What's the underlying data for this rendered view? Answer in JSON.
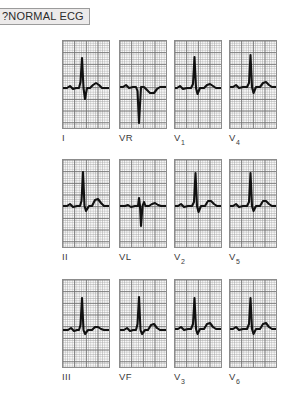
{
  "caption": {
    "text": "?NORMAL ECG"
  },
  "figure": {
    "name": "12-lead-ecg",
    "rows": 3,
    "columns": 4,
    "grid_color": "#6e6e6e",
    "trace_color": "#111111",
    "panel_border_color": "#8c8c8c",
    "paper_color": "#fbfbfb"
  },
  "chart_data": {
    "type": "line",
    "title": "?NORMAL ECG",
    "subtitle": "",
    "xlabel": "",
    "ylabel": "",
    "grid": true,
    "legend_position": "below-each-panel",
    "panel_layout": [
      [
        "I",
        "VR",
        "V1",
        "V4"
      ],
      [
        "II",
        "VL",
        "V2",
        "V5"
      ],
      [
        "III",
        "VF",
        "V3",
        "V6"
      ]
    ],
    "series": [
      {
        "name": "I",
        "label_base": "I",
        "label_sub": "",
        "row": 0,
        "column": 0,
        "baseline_y": 47,
        "qrs_direction": "positive",
        "r_amplitude": 30,
        "s_amplitude": 11,
        "t_amplitude": 5,
        "path": "M -6,47 L 4,47 L 7,45 L 10,48 L 13,47 L 16,47 L 17.5,41 L 19,17 L 20.5,47 L 22,58 L 24,47 L 27,47 L 30,44 L 33,42 L 36,44 L 39,47 L 54,47"
      },
      {
        "name": "VR",
        "label_base": "VR",
        "label_sub": "",
        "row": 0,
        "column": 1,
        "baseline_y": 46,
        "qrs_direction": "negative",
        "r_amplitude": 0,
        "s_amplitude": 36,
        "t_amplitude": -5,
        "path": "M -6,46 L 3,46 L 6,44 L 9,47 L 13,46 L 16,46 L 17.5,50 L 19,82 L 21,46 L 24,46 L 27,49 L 30,52 L 34,52 L 37,48 L 40,46 L 54,46"
      },
      {
        "name": "V1",
        "label_base": "V",
        "label_sub": "1",
        "row": 0,
        "column": 2,
        "baseline_y": 47,
        "qrs_direction": "positive",
        "r_amplitude": 31,
        "s_amplitude": 6,
        "t_amplitude": 4,
        "path": "M -6,47 L 2,47 L 5,45 L 8,48 L 12,47 L 16,47 L 18,43 L 19.5,16 L 21,47 L 22.5,53 L 25,47 L 29,47 L 32,44 L 35,43 L 38,45 L 41,47 L 54,47"
      },
      {
        "name": "V4",
        "label_base": "V",
        "label_sub": "4",
        "row": 0,
        "column": 3,
        "baseline_y": 46,
        "qrs_direction": "positive",
        "r_amplitude": 32,
        "s_amplitude": 6,
        "t_amplitude": 5,
        "path": "M -6,46 L 3,46 L 6,44 L 9,47 L 13,46 L 17,46 L 19,42 L 20.5,14 L 22,46 L 23.5,52 L 26,46 L 30,46 L 33,42 L 36,41 L 39,44 L 42,46 L 54,46"
      },
      {
        "name": "II",
        "label_base": "II",
        "label_sub": "",
        "row": 1,
        "column": 0,
        "baseline_y": 46,
        "qrs_direction": "positive",
        "r_amplitude": 34,
        "s_amplitude": 5,
        "t_amplitude": 6,
        "path": "M -6,46 L 4,46 L 7,44 L 10,47 L 14,46 L 17,46 L 18.5,41 L 20,12 L 21.5,46 L 23,51 L 26,46 L 29,46 L 32,40 L 35,39 L 38,43 L 41,46 L 54,46"
      },
      {
        "name": "VL",
        "label_base": "VL",
        "label_sub": "",
        "row": 1,
        "column": 1,
        "baseline_y": 46,
        "qrs_direction": "equiphasic",
        "r_amplitude": 9,
        "s_amplitude": 20,
        "t_amplitude": 3,
        "path": "M -6,46 L 5,46 L 8,45 L 11,47 L 15,46 L 18,46 L 19,38 L 20,46 L 21,66 L 22.5,46 L 24,42 L 25.5,46 L 29,46 L 32,44 L 35,43 L 38,45 L 41,46 L 54,46"
      },
      {
        "name": "V2",
        "label_base": "V",
        "label_sub": "2",
        "row": 1,
        "column": 2,
        "baseline_y": 46,
        "qrs_direction": "positive",
        "r_amplitude": 33,
        "s_amplitude": 6,
        "t_amplitude": 5,
        "path": "M -6,46 L 3,46 L 6,44 L 9,47 L 13,46 L 17,46 L 19,42 L 20.5,13 L 22,46 L 23.5,52 L 26,46 L 30,46 L 33,41 L 36,41 L 39,44 L 42,46 L 54,46"
      },
      {
        "name": "V5",
        "label_base": "V",
        "label_sub": "5",
        "row": 1,
        "column": 3,
        "baseline_y": 46,
        "qrs_direction": "positive",
        "r_amplitude": 33,
        "s_amplitude": 5,
        "t_amplitude": 5,
        "path": "M -6,46 L 3,46 L 6,44 L 9,47 L 13,46 L 17,46 L 19,42 L 20.5,13 L 22,46 L 23.5,51 L 26,46 L 30,46 L 33,41 L 36,41 L 39,44 L 42,46 L 54,46"
      },
      {
        "name": "III",
        "label_base": "III",
        "label_sub": "",
        "row": 2,
        "column": 0,
        "baseline_y": 50,
        "qrs_direction": "positive",
        "r_amplitude": 32,
        "s_amplitude": 4,
        "t_amplitude": 4,
        "path": "M -6,50 L 5,50 L 8,48 L 11,51 L 14,50 L 16,50 L 17.5,45 L 19,18 L 20.5,50 L 22,54 L 25,50 L 29,50 L 32,47 L 35,47 L 38,49 L 41,50 L 54,50"
      },
      {
        "name": "VF",
        "label_base": "VF",
        "label_sub": "",
        "row": 2,
        "column": 1,
        "baseline_y": 50,
        "qrs_direction": "positive",
        "r_amplitude": 33,
        "s_amplitude": 4,
        "t_amplitude": 5,
        "path": "M -6,50 L 4,50 L 7,48 L 10,51 L 13,50 L 16,50 L 17.5,44 L 19,17 L 20.5,50 L 22,54 L 25,50 L 28,50 L 31,45 L 34,44 L 37,48 L 40,50 L 54,50"
      },
      {
        "name": "V3",
        "label_base": "V",
        "label_sub": "3",
        "row": 2,
        "column": 2,
        "baseline_y": 49,
        "qrs_direction": "positive",
        "r_amplitude": 31,
        "s_amplitude": 5,
        "t_amplitude": 5,
        "path": "M -6,49 L 3,49 L 6,47 L 9,50 L 13,49 L 16,49 L 18,44 L 19.5,18 L 21,49 L 22.5,54 L 25,49 L 29,49 L 32,44 L 35,43 L 38,47 L 41,49 L 54,49"
      },
      {
        "name": "V6",
        "label_base": "V",
        "label_sub": "6",
        "row": 2,
        "column": 3,
        "baseline_y": 49,
        "qrs_direction": "positive",
        "r_amplitude": 31,
        "s_amplitude": 5,
        "t_amplitude": 5,
        "path": "M -6,49 L 3,49 L 6,47 L 9,50 L 13,49 L 17,49 L 19,44 L 20.5,18 L 22,49 L 23.5,54 L 26,49 L 30,49 L 33,44 L 36,43 L 39,47 L 42,49 L 54,49"
      }
    ]
  }
}
